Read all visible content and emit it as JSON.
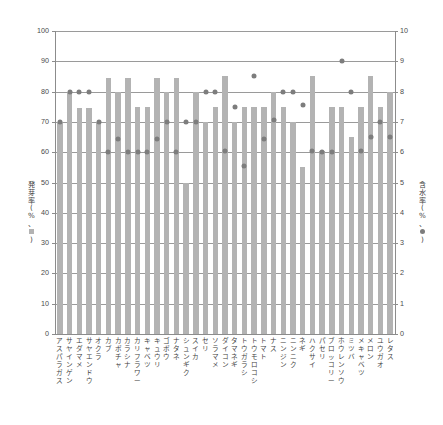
{
  "chart_data": {
    "type": "bar",
    "title": "",
    "subtitle": "",
    "xlabel": "",
    "ylabel": "発芽率(%、■)",
    "y2label": "含水率(%、●)",
    "ylim": [
      0,
      100
    ],
    "y2lim": [
      0,
      10
    ],
    "grid": true,
    "legend_position": "axis-titles",
    "colors": {
      "bar": "#b3b3b3",
      "dot": "#7d7d7d",
      "grid": "#9a9a9a",
      "axis": "#8c8c8c"
    },
    "yticks": [
      "0",
      "10",
      "20",
      "30",
      "40",
      "50",
      "60",
      "70",
      "80",
      "90",
      "100"
    ],
    "y2ticks": [
      "0",
      "1",
      "2",
      "3",
      "4",
      "5",
      "6",
      "7",
      "8",
      "9",
      "10"
    ],
    "categories": [
      "アスパラガス",
      "サヤインゲン",
      "エダマメ",
      "サヤエンドウ",
      "オクラ",
      "カブ",
      "カボチャ",
      "カラシナ",
      "カリフラワー",
      "キャベツ",
      "キュウリ",
      "ゴボウ",
      "ナタネ",
      "シュンギク",
      "スイカ",
      "セリ",
      "ソラマメ",
      "ダイコン",
      "タマネギ",
      "トウガラシ",
      "トウモロコシ",
      "トマト",
      "ナス",
      "ニンジン",
      "ニンニク",
      "ネギ",
      "ハクサイ",
      "パセリ",
      "ブロッコリー",
      "ホウレンソウ",
      "ミツバ",
      "メキャベツ",
      "メロン",
      "ユウガオ",
      "レタス"
    ],
    "series": [
      {
        "name": "発芽率",
        "axis": "left",
        "unit": "%",
        "marker": "bar",
        "values": [
          70,
          80,
          74.5,
          74.5,
          70,
          84.5,
          80,
          84.5,
          75,
          75,
          84.5,
          80,
          84.5,
          50,
          80,
          70,
          75,
          85,
          70,
          75,
          75,
          75,
          80,
          75,
          70,
          55,
          85,
          60.5,
          75,
          75,
          65,
          75,
          85,
          75,
          80
        ]
      },
      {
        "name": "含水率",
        "axis": "right",
        "unit": "%",
        "marker": "dot",
        "values": [
          7.0,
          8.0,
          8.0,
          8.0,
          7.0,
          6.0,
          6.45,
          6.0,
          6.0,
          6.0,
          6.45,
          7.0,
          6.0,
          7.0,
          7.0,
          8.0,
          8.0,
          6.05,
          7.5,
          5.55,
          8.5,
          6.45,
          7.05,
          8.0,
          8.0,
          7.55,
          6.05,
          6.0,
          6.0,
          9.0,
          8.0,
          6.05,
          6.5,
          7.0,
          6.5
        ]
      }
    ]
  },
  "axis": {
    "left_title_chars": [
      "発",
      "芽",
      "率",
      "(",
      "%",
      "、",
      "■",
      ")"
    ],
    "right_title_chars": [
      "含",
      "水",
      "率",
      "(",
      "%",
      "、",
      "●",
      ")"
    ]
  }
}
